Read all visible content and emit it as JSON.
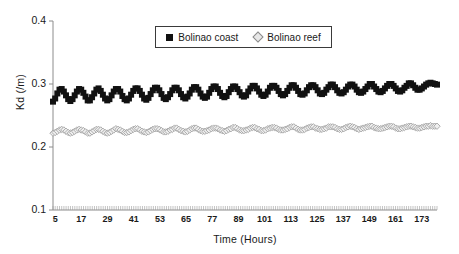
{
  "chart_data": {
    "type": "line",
    "title": "",
    "xlabel": "Time (Hours)",
    "ylabel": "Kd (/m)",
    "xlim": [
      4,
      180
    ],
    "ylim": [
      0.1,
      0.4
    ],
    "grid": false,
    "legend_position": "top-center",
    "y_ticks": [
      "0.4",
      "0.3",
      "0.2",
      "0.1"
    ],
    "y_tick_values": [
      0.4,
      0.3,
      0.2,
      0.1
    ],
    "x_ticks": [
      "5",
      "17",
      "29",
      "41",
      "53",
      "65",
      "77",
      "89",
      "101",
      "113",
      "125",
      "137",
      "149",
      "161",
      "173"
    ],
    "x_tick_values": [
      5,
      17,
      29,
      41,
      53,
      65,
      77,
      89,
      101,
      113,
      125,
      137,
      149,
      161,
      173
    ],
    "x_minor_tick_step": 1,
    "series": [
      {
        "name": "Bolinao coast",
        "marker": "filled-square",
        "color": "#111111",
        "oscillation_period_hours": 12,
        "amplitude": 0.011,
        "mean_start": 0.281,
        "mean_end": 0.297,
        "values": [
          0.272,
          0.277,
          0.285,
          0.291,
          0.292,
          0.288,
          0.282,
          0.276,
          0.273,
          0.276,
          0.282,
          0.288,
          0.292,
          0.291,
          0.286,
          0.28,
          0.274,
          0.274,
          0.279,
          0.285,
          0.291,
          0.293,
          0.289,
          0.283,
          0.277,
          0.274,
          0.276,
          0.282,
          0.288,
          0.292,
          0.292,
          0.288,
          0.281,
          0.276,
          0.274,
          0.277,
          0.283,
          0.289,
          0.293,
          0.293,
          0.289,
          0.283,
          0.277,
          0.275,
          0.278,
          0.284,
          0.29,
          0.294,
          0.294,
          0.29,
          0.284,
          0.278,
          0.276,
          0.279,
          0.284,
          0.29,
          0.294,
          0.294,
          0.29,
          0.284,
          0.279,
          0.277,
          0.28,
          0.285,
          0.291,
          0.295,
          0.295,
          0.291,
          0.285,
          0.28,
          0.278,
          0.28,
          0.286,
          0.292,
          0.296,
          0.296,
          0.292,
          0.286,
          0.281,
          0.279,
          0.281,
          0.287,
          0.292,
          0.296,
          0.296,
          0.292,
          0.287,
          0.282,
          0.28,
          0.282,
          0.288,
          0.293,
          0.297,
          0.297,
          0.293,
          0.288,
          0.283,
          0.281,
          0.283,
          0.288,
          0.294,
          0.297,
          0.297,
          0.294,
          0.289,
          0.284,
          0.282,
          0.284,
          0.289,
          0.294,
          0.298,
          0.298,
          0.294,
          0.289,
          0.284,
          0.283,
          0.285,
          0.29,
          0.295,
          0.298,
          0.298,
          0.295,
          0.29,
          0.285,
          0.284,
          0.286,
          0.291,
          0.295,
          0.299,
          0.299,
          0.295,
          0.29,
          0.286,
          0.285,
          0.287,
          0.291,
          0.296,
          0.299,
          0.299,
          0.296,
          0.291,
          0.287,
          0.286,
          0.288,
          0.292,
          0.296,
          0.3,
          0.3,
          0.296,
          0.292,
          0.288,
          0.287,
          0.289,
          0.293,
          0.297,
          0.3,
          0.3,
          0.297,
          0.293,
          0.289,
          0.288,
          0.29,
          0.294,
          0.297,
          0.301,
          0.301,
          0.298,
          0.294,
          0.291,
          0.291,
          0.293,
          0.296,
          0.299,
          0.301,
          0.302,
          0.301,
          0.3,
          0.299
        ]
      },
      {
        "name": "Bolinao reef",
        "marker": "open-diamond",
        "color": "#9a9a9a",
        "oscillation_period_hours": 12,
        "amplitude": 0.004,
        "mean_start": 0.225,
        "mean_end": 0.232,
        "values": [
          0.222,
          0.223,
          0.225,
          0.227,
          0.228,
          0.227,
          0.225,
          0.223,
          0.222,
          0.223,
          0.225,
          0.227,
          0.228,
          0.227,
          0.226,
          0.224,
          0.222,
          0.222,
          0.224,
          0.226,
          0.228,
          0.228,
          0.227,
          0.225,
          0.223,
          0.222,
          0.223,
          0.225,
          0.227,
          0.229,
          0.228,
          0.227,
          0.225,
          0.223,
          0.223,
          0.224,
          0.226,
          0.228,
          0.229,
          0.229,
          0.227,
          0.225,
          0.224,
          0.223,
          0.224,
          0.226,
          0.228,
          0.229,
          0.229,
          0.228,
          0.226,
          0.224,
          0.224,
          0.225,
          0.227,
          0.228,
          0.23,
          0.23,
          0.228,
          0.226,
          0.225,
          0.224,
          0.225,
          0.227,
          0.229,
          0.23,
          0.23,
          0.228,
          0.226,
          0.225,
          0.225,
          0.226,
          0.227,
          0.229,
          0.23,
          0.23,
          0.229,
          0.227,
          0.226,
          0.225,
          0.226,
          0.228,
          0.229,
          0.231,
          0.231,
          0.229,
          0.227,
          0.226,
          0.226,
          0.227,
          0.228,
          0.23,
          0.231,
          0.231,
          0.229,
          0.228,
          0.226,
          0.226,
          0.227,
          0.229,
          0.23,
          0.231,
          0.231,
          0.23,
          0.228,
          0.227,
          0.227,
          0.228,
          0.229,
          0.231,
          0.232,
          0.232,
          0.23,
          0.228,
          0.227,
          0.227,
          0.228,
          0.23,
          0.231,
          0.232,
          0.232,
          0.23,
          0.229,
          0.228,
          0.228,
          0.229,
          0.23,
          0.232,
          0.232,
          0.232,
          0.231,
          0.229,
          0.228,
          0.228,
          0.229,
          0.231,
          0.232,
          0.233,
          0.232,
          0.231,
          0.229,
          0.228,
          0.229,
          0.23,
          0.231,
          0.232,
          0.233,
          0.233,
          0.231,
          0.23,
          0.229,
          0.229,
          0.23,
          0.231,
          0.232,
          0.233,
          0.233,
          0.232,
          0.23,
          0.229,
          0.229,
          0.23,
          0.231,
          0.232,
          0.233,
          0.233,
          0.232,
          0.231,
          0.23,
          0.23,
          0.231,
          0.232,
          0.233,
          0.233,
          0.234,
          0.233,
          0.233,
          0.233
        ]
      }
    ]
  },
  "legend": {
    "entries": [
      {
        "label": "Bolinao coast"
      },
      {
        "label": "Bolinao reef"
      }
    ]
  }
}
